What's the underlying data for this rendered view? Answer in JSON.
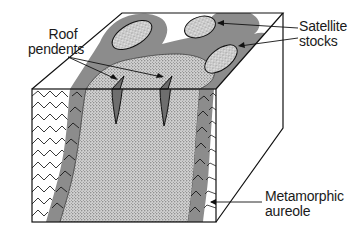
{
  "diagram": {
    "type": "geological block diagram",
    "labels": {
      "roof_pendents": {
        "line1": "Roof",
        "line2": "pendents"
      },
      "satellite_stocks": {
        "line1": "Satellite",
        "line2": "stocks"
      },
      "metamorphic_aureole": {
        "line1": "Metamorphic",
        "line2": "aureole"
      }
    },
    "components": [
      {
        "name": "Country rock",
        "pattern": "folded zig-zag strata",
        "color": "#ffffff"
      },
      {
        "name": "Metamorphic aureole",
        "pattern": "grey band",
        "color": "#8a8a8a"
      },
      {
        "name": "Batholith / intrusion",
        "pattern": "stippled",
        "color": "#cfcfcf"
      },
      {
        "name": "Satellite stocks",
        "pattern": "stippled islands ringed by aureole",
        "count": 3
      },
      {
        "name": "Roof pendents",
        "pattern": "dark wedge-shaped slivers",
        "count": 2
      }
    ],
    "colors": {
      "outline": "#1a1a1a",
      "aureole": "#8c8c8c",
      "intrusion": "#d4d4d4",
      "stipple": "#4a4a4a",
      "background": "#ffffff"
    }
  }
}
